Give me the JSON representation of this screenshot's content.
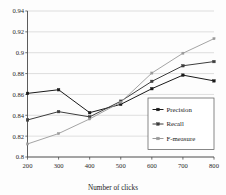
{
  "chart_data": {
    "type": "line",
    "title": "",
    "xlabel": "Number of clicks",
    "ylabel": "",
    "categories": [
      200,
      300,
      400,
      500,
      600,
      700,
      800
    ],
    "x_tick_labels": [
      "200",
      "300",
      "400",
      "500",
      "600",
      "700",
      "800"
    ],
    "y_tick_labels": [
      "0.8",
      "0.82",
      "0.84",
      "0.86",
      "0.88",
      "0.9",
      "0.92",
      "0.94"
    ],
    "y_ticks": [
      0.8,
      0.82,
      0.84,
      0.86,
      0.88,
      0.9,
      0.92,
      0.94
    ],
    "ylim": [
      0.8,
      0.94
    ],
    "xlim": [
      200,
      800
    ],
    "grid": true,
    "grid_axis": "y",
    "legend_position": "center-right",
    "series": [
      {
        "name": "Precision",
        "values": [
          0.861,
          0.8645,
          0.8425,
          0.8505,
          0.8655,
          0.8785,
          0.873
        ],
        "color": "#1a1a1a",
        "marker": "square",
        "line_style": "solid"
      },
      {
        "name": "Recall",
        "values": [
          0.8355,
          0.8435,
          0.8385,
          0.8535,
          0.8725,
          0.8875,
          0.8915
        ],
        "color": "#3d3d3d",
        "marker": "square",
        "line_style": "solid"
      },
      {
        "name": "F-measure",
        "values": [
          0.8125,
          0.8225,
          0.8365,
          0.8525,
          0.8805,
          0.8995,
          0.9135
        ],
        "color": "#9a9a9a",
        "marker": "square",
        "line_style": "solid"
      }
    ]
  },
  "legend": {
    "items": [
      {
        "label": "Precision"
      },
      {
        "label": "Recall"
      },
      {
        "label": "F-measure"
      }
    ]
  },
  "axes": {
    "x_title": "Number of clicks"
  }
}
